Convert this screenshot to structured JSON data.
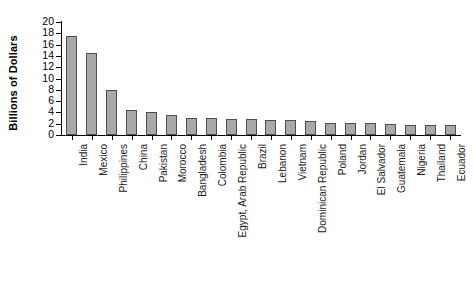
{
  "chart_data": {
    "type": "bar",
    "title": "",
    "xlabel": "",
    "ylabel": "Billions of Dollars",
    "ylim": [
      0,
      20
    ],
    "ytick_step": 2,
    "grid": false,
    "legend": null,
    "bar_fill_color": "#a8a8a8",
    "bar_edge_color": "#4d4d4d",
    "axis_color": "#000000",
    "background_color": "#ffffff",
    "categories": [
      "India",
      "Mexico",
      "Philippines",
      "China",
      "Pakistan",
      "Morocco",
      "Bangladesh",
      "Colombia",
      "Egypt, Arab Republic",
      "Brazil",
      "Lebanon",
      "Vietnam",
      "Dominican Republic",
      "Poland",
      "Jordan",
      "El Salvador",
      "Guatemala",
      "Nigeria",
      "Thailand",
      "Ecuador"
    ],
    "values": [
      17.5,
      14.6,
      7.9,
      4.5,
      4.1,
      3.6,
      3.1,
      3.1,
      2.9,
      2.8,
      2.6,
      2.6,
      2.4,
      2.2,
      2.2,
      2.1,
      2.0,
      1.8,
      1.8,
      1.8
    ],
    "ytick_labels": [
      "0",
      "2",
      "4",
      "6",
      "8",
      "10",
      "12",
      "14",
      "16",
      "18",
      "20"
    ],
    "ytick_values": [
      0,
      2,
      4,
      6,
      8,
      10,
      12,
      14,
      16,
      18,
      20
    ]
  }
}
